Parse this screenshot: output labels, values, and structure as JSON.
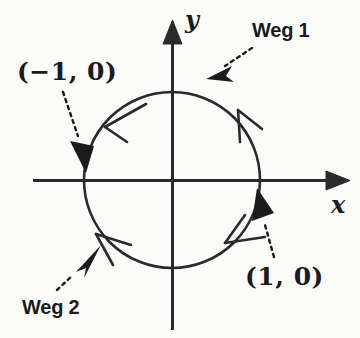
{
  "figure": {
    "background_color": "#fbfbfa",
    "ink_color": "#1b1b1b"
  },
  "axes": {
    "x_label": "x",
    "y_label": "y",
    "origin": {
      "x": 172,
      "y": 180
    },
    "x_range_px": [
      33,
      345
    ],
    "y_range_px": [
      22,
      330
    ]
  },
  "curve": {
    "name": "unit-circle",
    "center": {
      "x": 172,
      "y": 180
    },
    "radius_px": 88,
    "radius_units": 1
  },
  "points": [
    {
      "id": "left-point",
      "label": "(−1, 0)",
      "x": -1,
      "y": 0
    },
    {
      "id": "right-point",
      "label": "(1, 0)",
      "x": 1,
      "y": 0
    }
  ],
  "paths": [
    {
      "id": "weg1",
      "label": "Weg 1",
      "description": "upper semicircular arc traversed counterclockwise from (1,0) to (-1,0)",
      "orientation": "counterclockwise"
    },
    {
      "id": "weg2",
      "label": "Weg 2",
      "description": "lower semicircular arc traversed clockwise from (1,0) to (-1,0)",
      "orientation": "clockwise"
    }
  ],
  "direction_markers": [
    {
      "id": "marker-upper-left",
      "on_path": "weg1",
      "angle_deg": 140,
      "points_toward": "counterclockwise"
    },
    {
      "id": "marker-upper-right",
      "on_path": "weg1",
      "angle_deg": 52,
      "points_toward": "counterclockwise"
    },
    {
      "id": "marker-lower-right",
      "on_path": "weg2",
      "angle_deg": -52,
      "points_toward": "clockwise"
    },
    {
      "id": "marker-lower-left",
      "on_path": "weg2",
      "angle_deg": -140,
      "points_toward": "clockwise"
    }
  ],
  "leaders": [
    {
      "id": "leader-weg1",
      "from_label": "Weg 1",
      "style": "dotted-with-solid-arrowhead"
    },
    {
      "id": "leader-weg2",
      "from_label": "Weg 2",
      "style": "dotted-with-solid-arrowhead"
    },
    {
      "id": "leader-neg-one",
      "from_label": "(−1, 0)",
      "style": "dotted-with-solid-arrowhead"
    },
    {
      "id": "leader-pos-one",
      "from_label": "(1, 0)",
      "style": "dotted-with-solid-arrowhead"
    }
  ]
}
